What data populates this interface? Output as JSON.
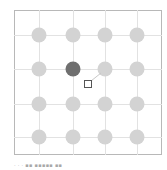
{
  "board": {
    "rows": 4,
    "cols": 4,
    "col_x": [
      39,
      73,
      105,
      137
    ],
    "row_y": [
      35,
      69,
      104,
      137
    ],
    "colors": {
      "node": "#d3d3d3",
      "selected": "#6f6f6f",
      "grid": "#e2e2e2",
      "frame": "#b8b8b8"
    },
    "selected": {
      "row": 1,
      "col": 1
    },
    "cursor": {
      "x": 88,
      "y": 84,
      "linked_row": 1,
      "linked_col": 2
    }
  },
  "caption": {
    "text": "· · ·   ▪▪ ▪▪▪▪▪ ▪▪"
  }
}
